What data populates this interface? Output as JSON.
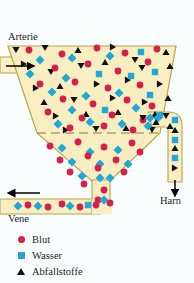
{
  "diagram": {
    "labels": {
      "arterie": "Arterie",
      "vene": "Vene",
      "harn": "Harn"
    },
    "colors": {
      "background": "#fafdfd",
      "fluid": "#f8eec2",
      "vessel_outline": "#b9a447",
      "blood": "#d6204a",
      "water": "#1fa8d8",
      "waste": "#111111",
      "arrow": "#000000",
      "membrane": "#8c7a30",
      "text": "#1c1c1c"
    },
    "membrane": {
      "style": "dashed",
      "y": 133,
      "x_start": 37,
      "x_end": 160
    },
    "arrows": [
      {
        "name": "arterie-inflow-arrow",
        "direction": "right",
        "x1": 6,
        "y1": 66,
        "x2": 34,
        "y2": 66
      },
      {
        "name": "vene-outflow-arrow",
        "direction": "left",
        "x1": 40,
        "y1": 193,
        "x2": 8,
        "y2": 193
      },
      {
        "name": "harn-outflow-arrow",
        "direction": "down",
        "x1": 175,
        "y1": 180,
        "x2": 175,
        "y2": 196
      }
    ]
  },
  "legend": {
    "items": [
      {
        "marker": "circle-icon",
        "color": "#d6204a",
        "label": "Blut"
      },
      {
        "marker": "square-icon",
        "color": "#1fa8d8",
        "label": "Wasser"
      },
      {
        "marker": "triangle-icon",
        "color": "#111111",
        "label": "Abfallstoffe"
      }
    ]
  },
  "particles": {
    "upper_chamber": {
      "blood": [
        [
          29,
          50
        ],
        [
          62,
          54
        ],
        [
          97,
          48
        ],
        [
          125,
          53
        ],
        [
          157,
          49
        ],
        [
          55,
          68
        ],
        [
          88,
          64
        ],
        [
          118,
          71
        ],
        [
          148,
          62
        ],
        [
          40,
          84
        ],
        [
          75,
          82
        ],
        [
          108,
          88
        ],
        [
          140,
          85
        ],
        [
          63,
          99
        ],
        [
          93,
          104
        ],
        [
          127,
          100
        ],
        [
          152,
          106
        ],
        [
          48,
          112
        ],
        [
          82,
          118
        ],
        [
          112,
          115
        ],
        [
          143,
          120
        ],
        [
          70,
          128
        ],
        [
          104,
          126
        ],
        [
          133,
          130
        ]
      ],
      "water": [
        [
          40,
          60
        ],
        [
          72,
          58
        ],
        [
          110,
          56
        ],
        [
          141,
          52
        ],
        [
          30,
          74
        ],
        [
          66,
          78
        ],
        [
          99,
          74
        ],
        [
          131,
          76
        ],
        [
          155,
          72
        ],
        [
          52,
          92
        ],
        [
          86,
          96
        ],
        [
          119,
          93
        ],
        [
          150,
          95
        ],
        [
          72,
          110
        ],
        [
          105,
          110
        ],
        [
          136,
          108
        ],
        [
          158,
          118
        ],
        [
          58,
          124
        ],
        [
          90,
          122
        ],
        [
          122,
          124
        ],
        [
          148,
          126
        ]
      ],
      "waste": [
        [
          16,
          50
        ],
        [
          45,
          48
        ],
        [
          78,
          50
        ],
        [
          113,
          47
        ],
        [
          135,
          60
        ],
        [
          166,
          52
        ],
        [
          24,
          64
        ],
        [
          51,
          72
        ],
        [
          81,
          66
        ],
        [
          105,
          62
        ],
        [
          142,
          68
        ],
        [
          170,
          66
        ],
        [
          36,
          88
        ],
        [
          60,
          86
        ],
        [
          97,
          84
        ],
        [
          128,
          80
        ],
        [
          160,
          84
        ],
        [
          44,
          102
        ],
        [
          74,
          100
        ],
        [
          113,
          98
        ],
        [
          145,
          102
        ],
        [
          168,
          98
        ],
        [
          56,
          116
        ],
        [
          86,
          114
        ],
        [
          118,
          112
        ],
        [
          155,
          114
        ],
        [
          66,
          130
        ],
        [
          96,
          129
        ],
        [
          126,
          128
        ],
        [
          152,
          130
        ],
        [
          170,
          126
        ]
      ]
    },
    "lower_chamber": {
      "blood": [
        [
          50,
          146
        ],
        [
          78,
          142
        ],
        [
          104,
          147
        ],
        [
          132,
          143
        ],
        [
          60,
          160
        ],
        [
          88,
          156
        ],
        [
          116,
          160
        ],
        [
          140,
          152
        ],
        [
          70,
          172
        ],
        [
          98,
          168
        ],
        [
          124,
          172
        ],
        [
          84,
          184
        ],
        [
          104,
          190
        ],
        [
          98,
          200
        ]
      ],
      "water": [
        [
          62,
          148
        ],
        [
          90,
          152
        ],
        [
          118,
          150
        ],
        [
          72,
          162
        ],
        [
          100,
          164
        ],
        [
          128,
          164
        ],
        [
          82,
          176
        ],
        [
          110,
          178
        ],
        [
          100,
          178
        ]
      ]
    },
    "vene_tube": {
      "blood": [
        [
          28,
          205
        ],
        [
          48,
          207
        ],
        [
          62,
          204
        ],
        [
          80,
          207
        ],
        [
          96,
          205
        ],
        [
          110,
          203
        ]
      ],
      "water": [
        [
          18,
          206
        ],
        [
          38,
          206
        ],
        [
          70,
          206
        ],
        [
          88,
          205
        ],
        [
          104,
          200
        ]
      ]
    },
    "harn_tube": {
      "water": [
        [
          175,
          120
        ],
        [
          175,
          140
        ],
        [
          175,
          158
        ],
        [
          160,
          115
        ],
        [
          150,
          118
        ]
      ],
      "waste": [
        [
          175,
          130
        ],
        [
          175,
          148
        ],
        [
          175,
          168
        ],
        [
          166,
          116
        ],
        [
          156,
          122
        ],
        [
          143,
          118
        ]
      ]
    }
  }
}
